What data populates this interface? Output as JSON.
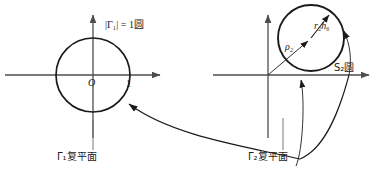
{
  "figure": {
    "title_visible": false,
    "background": "#ffffff",
    "stroke_color": "#1a1a1a",
    "axis_color": "#4d4d4d",
    "thin_color": "#555555"
  },
  "left_panel": {
    "name": "gamma1-complex-plane",
    "plane_label": "Γ₁复平面",
    "circle_label": "|Γ₁| = 1圆",
    "origin_label": "O",
    "axis_tick_label": "1",
    "circle": {
      "center_x": 93,
      "center_y": 75,
      "radius": 37,
      "radius_value": 1
    },
    "x_axis": {
      "y": 75,
      "x_start": 5,
      "x_end": 163,
      "arrow": "right"
    },
    "y_axis": {
      "x": 93,
      "y_start": 12,
      "y_end": 140,
      "arrow": "up"
    }
  },
  "right_panel": {
    "name": "gamma2-complex-plane",
    "plane_label": "Γ₂复平面",
    "circle_label": "S₂圆",
    "rho_label": "ρ₂",
    "radius_label": "r₂h₆",
    "circle": {
      "center_x": 311,
      "center_y": 38,
      "radius": 33
    },
    "x_axis": {
      "y": 75,
      "x_start": 213,
      "x_end": 372,
      "arrow": "right"
    },
    "y_axis": {
      "x": 268,
      "y_start": 12,
      "y_end": 140,
      "arrow": "up"
    },
    "rho_arrow": {
      "from_x": 268,
      "from_y": 75,
      "to_x": 311,
      "to_y": 38
    },
    "radius_arrow": {
      "from_x": 311,
      "from_y": 38,
      "to_x": 330,
      "to_y": 14
    }
  },
  "connector": {
    "name": "mapping-curve",
    "description": "curve linking the two complex planes",
    "arrow_left": true,
    "arrow_right": true
  },
  "icons": {
    "arrowhead": "arrowhead-icon"
  }
}
